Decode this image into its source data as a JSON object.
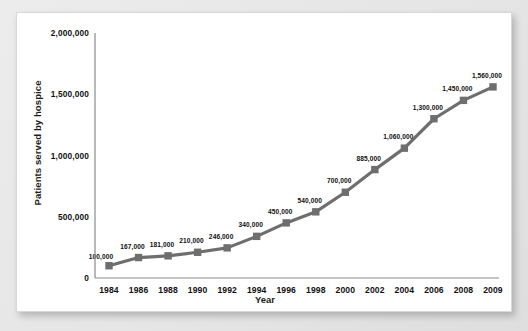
{
  "chart_data": {
    "type": "line",
    "title": "",
    "xlabel": "Year",
    "ylabel": "Patients served by hospice",
    "categories": [
      "1984",
      "1986",
      "1988",
      "1990",
      "1992",
      "1994",
      "1996",
      "1998",
      "2000",
      "2002",
      "2004",
      "2006",
      "2008",
      "2009"
    ],
    "values": [
      100000,
      167000,
      181000,
      210000,
      246000,
      340000,
      450000,
      540000,
      700000,
      885000,
      1060000,
      1300000,
      1450000,
      1560000
    ],
    "point_labels": [
      "100,000",
      "167,000",
      "181,000",
      "210,000",
      "246,000",
      "340,000",
      "450,000",
      "540,000",
      "700,000",
      "885,000",
      "1,060,000",
      "1,300,000",
      "1,450,000",
      "1,560,000"
    ],
    "ylim": [
      0,
      2000000
    ],
    "yticks": [
      0,
      500000,
      1000000,
      1500000,
      2000000
    ],
    "ytick_labels": [
      "0",
      "500,000",
      "1,000,000",
      "1,500,000",
      "2,000,000"
    ],
    "grid": false,
    "legend": "none",
    "series_color": "#6e6e6e",
    "marker": "square",
    "axis_color": "#8a8a8a",
    "background": "#ffffff"
  }
}
